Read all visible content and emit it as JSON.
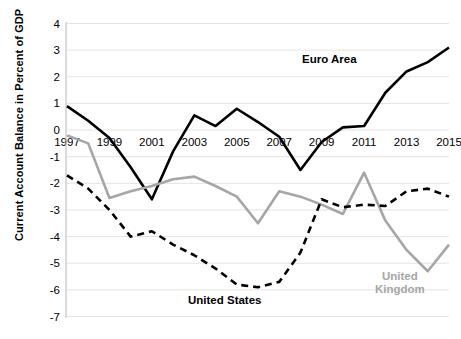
{
  "chart_data": {
    "type": "line",
    "title": "",
    "xlabel": "",
    "ylabel": "Current Account Balance in Percent of GDP",
    "x": [
      1997,
      1998,
      1999,
      2000,
      2001,
      2002,
      2003,
      2004,
      2005,
      2006,
      2007,
      2008,
      2009,
      2010,
      2011,
      2012,
      2013,
      2014,
      2015
    ],
    "xtick_labels": [
      "1997",
      "1999",
      "2001",
      "2003",
      "2005",
      "2007",
      "2009",
      "2011",
      "2013",
      "2015"
    ],
    "xticks": [
      1997,
      1999,
      2001,
      2003,
      2005,
      2007,
      2009,
      2011,
      2013,
      2015
    ],
    "yticks": [
      4,
      3,
      2,
      1,
      0,
      -1,
      -2,
      -3,
      -4,
      -5,
      -6,
      -7
    ],
    "ytick_labels": [
      "4",
      "3",
      "2",
      "1",
      "0",
      "-1",
      "-2",
      "-3",
      "-4",
      "-5",
      "-6",
      "-7"
    ],
    "xlim": [
      1997,
      2015
    ],
    "ylim": [
      -7,
      4
    ],
    "grid": true,
    "grid_color": "#e3e3e3",
    "legend_position": "inline-annotations",
    "series": [
      {
        "name": "Euro Area",
        "style": "solid",
        "color": "#000000",
        "width": 2.6,
        "values": [
          0.9,
          0.35,
          -0.3,
          -1.4,
          -2.6,
          -0.8,
          0.55,
          0.15,
          0.8,
          0.3,
          -0.25,
          -1.5,
          -0.45,
          0.1,
          0.15,
          1.4,
          2.2,
          2.55,
          3.1
        ]
      },
      {
        "name": "United Kingdom",
        "style": "solid",
        "color": "#a6a6a6",
        "width": 2.6,
        "values": [
          -0.2,
          -0.5,
          -2.55,
          -2.3,
          -2.1,
          -1.85,
          -1.75,
          -2.1,
          -2.5,
          -3.5,
          -2.3,
          -2.5,
          -2.8,
          -3.15,
          -1.6,
          -3.4,
          -4.5,
          -5.3,
          -4.3
        ]
      },
      {
        "name": "United States",
        "style": "dashed",
        "color": "#000000",
        "width": 2.6,
        "values": [
          -1.7,
          -2.2,
          -3.0,
          -4.0,
          -3.8,
          -4.3,
          -4.7,
          -5.2,
          -5.8,
          -5.9,
          -5.7,
          -4.6,
          -2.6,
          -2.9,
          -2.8,
          -2.85,
          -2.3,
          -2.2,
          -2.5
        ]
      }
    ],
    "annotations": [
      {
        "name": "euro-area-label",
        "text": "Euro Area",
        "color": "#000000",
        "x_px": 302,
        "y_px": 53
      },
      {
        "name": "united-states-label",
        "text": "United States",
        "color": "#000000",
        "x_px": 188,
        "y_px": 294
      },
      {
        "name": "united-kingdom-label",
        "text": "United Kingdom",
        "color": "#a6a6a6",
        "x_px": 375,
        "y_px": 270
      }
    ]
  }
}
